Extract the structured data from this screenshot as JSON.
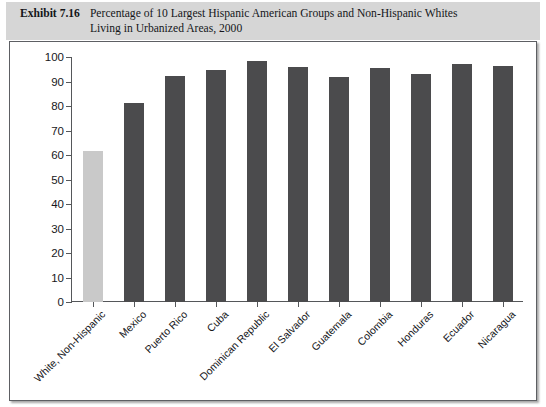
{
  "caption": {
    "label": "Exhibit 7.16",
    "line1": "Percentage of 10 Largest Hispanic American Groups and Non-Hispanic Whites",
    "line2": "Living in Urbanized Areas, 2000"
  },
  "colors": {
    "caption_band": "#d6d6d6",
    "panel_background": "#ffffff",
    "panel_border": "#5d5f63",
    "bar_dark": "#4b4b4d",
    "bar_light": "#c9c9c9",
    "axis": "#55575a",
    "text": "#15161a"
  },
  "chart_data": {
    "type": "bar",
    "title": "Percentage of 10 Largest Hispanic American Groups and Non-Hispanic Whites Living in Urbanized Areas, 2000",
    "xlabel": "",
    "ylabel": "",
    "ylim": [
      0,
      100
    ],
    "yticks": [
      0,
      10,
      20,
      30,
      40,
      50,
      60,
      70,
      80,
      90,
      100
    ],
    "ytick_labels": [
      "0",
      "10",
      "20",
      "30",
      "40",
      "50",
      "60",
      "70",
      "80",
      "90",
      "100"
    ],
    "grid": false,
    "legend": "none",
    "categories": [
      "White, Non-Hispanic",
      "Mexico",
      "Puerto Rico",
      "Cuba",
      "Dominican Republic",
      "El Salvador",
      "Guatemala",
      "Colombia",
      "Honduras",
      "Ecuador",
      "Nicaragua"
    ],
    "values": [
      61.5,
      81.2,
      92.4,
      94.5,
      98.2,
      95.8,
      91.8,
      95.4,
      92.9,
      97.2,
      96.3
    ],
    "bar_colors": [
      "#c9c9c9",
      "#4b4b4d",
      "#4b4b4d",
      "#4b4b4d",
      "#4b4b4d",
      "#4b4b4d",
      "#4b4b4d",
      "#4b4b4d",
      "#4b4b4d",
      "#4b4b4d",
      "#4b4b4d"
    ]
  }
}
